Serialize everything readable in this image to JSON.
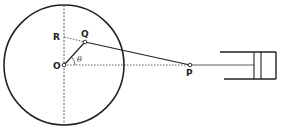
{
  "diagram": {
    "labels": {
      "O": "O",
      "Q": "Q",
      "R": "R",
      "P": "P",
      "theta": "θ"
    },
    "colors": {
      "ink": "#222222",
      "background": "#ffffff"
    },
    "elements": [
      "crank circle centered at O",
      "vertical dashed diameter through O",
      "horizontal dotted line of stroke O to P",
      "crank arm OQ",
      "connecting rod QP",
      "dotted projection Q to R",
      "angle theta between OQ and OP",
      "cylinder with piston at right"
    ]
  }
}
